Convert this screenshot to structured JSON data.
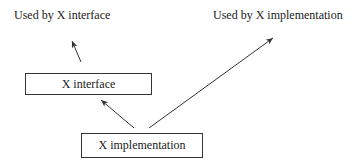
{
  "diagram": {
    "labels": {
      "used_by_interface": "Used by X interface",
      "used_by_implementation": "Used by X implementation"
    },
    "boxes": {
      "interface": "X interface",
      "implementation": "X implementation"
    },
    "edges": [
      {
        "from": "X interface",
        "to": "Used by X interface"
      },
      {
        "from": "X implementation",
        "to": "X interface"
      },
      {
        "from": "X implementation",
        "to": "Used by X implementation"
      }
    ]
  }
}
